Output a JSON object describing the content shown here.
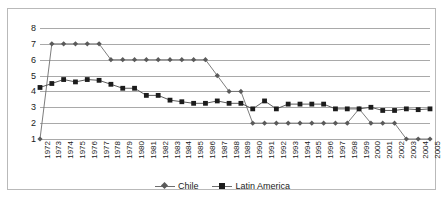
{
  "chart_data": {
    "type": "line",
    "title": "",
    "subtitle": "",
    "xlabel": "",
    "ylabel": "",
    "grid": true,
    "legend_position": "bottom-center",
    "ylim": [
      1,
      8
    ],
    "yticks": [
      1,
      2,
      3,
      4,
      5,
      6,
      7,
      8
    ],
    "ytick_labels": [
      "1",
      "2",
      "3",
      "4",
      "5",
      "6",
      "7",
      "8"
    ],
    "categories": [
      "1972",
      "1973",
      "1974",
      "1975",
      "1976",
      "1977",
      "1978",
      "1979",
      "1980",
      "1981",
      "1982",
      "1983",
      "1984",
      "1985",
      "1986",
      "1987",
      "1988",
      "1989",
      "1990",
      "1991",
      "1992",
      "1993",
      "1994",
      "1995",
      "1996",
      "1997",
      "1998",
      "1999",
      "2000",
      "2001",
      "2002",
      "2003",
      "2004",
      "2005"
    ],
    "series": [
      {
        "name": "Chile",
        "marker": "diamond",
        "color": "#5a5a5a",
        "values": [
          1,
          7,
          7,
          7,
          7,
          7,
          6,
          6,
          6,
          6,
          6,
          6,
          6,
          6,
          6,
          5,
          4,
          4,
          2,
          2,
          2,
          2,
          2,
          2,
          2,
          2,
          2,
          2.9,
          2,
          2,
          2,
          1,
          1,
          1
        ]
      },
      {
        "name": "Latin America",
        "marker": "square",
        "color": "#1c1c1c",
        "values": [
          4.25,
          4.5,
          4.75,
          4.6,
          4.75,
          4.7,
          4.45,
          4.2,
          4.2,
          3.75,
          3.75,
          3.45,
          3.35,
          3.25,
          3.25,
          3.4,
          3.25,
          3.25,
          2.9,
          3.4,
          2.9,
          3.2,
          3.2,
          3.2,
          3.2,
          2.9,
          2.9,
          2.9,
          3.0,
          2.8,
          2.8,
          2.9,
          2.85,
          2.9
        ]
      }
    ]
  },
  "legend": {
    "entries": [
      {
        "label": "Chile"
      },
      {
        "label": "Latin America"
      }
    ]
  }
}
